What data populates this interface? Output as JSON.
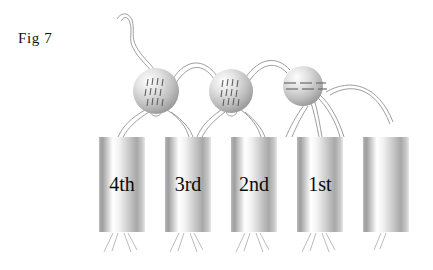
{
  "figure": {
    "label": "Fig 7",
    "background": "#ffffff",
    "ink": "#111111"
  },
  "cylinders": {
    "count": 5,
    "fill_light": "#ffffff",
    "fill_dark": "#9a9a9a",
    "geometry": {
      "top": 137,
      "bottom": 232,
      "width": 46,
      "gap": 20,
      "first_x": 99
    },
    "items": [
      {
        "name": "cylinder-4th",
        "label": "4th",
        "x": 99
      },
      {
        "name": "cylinder-3rd",
        "label": "3rd",
        "x": 165
      },
      {
        "name": "cylinder-2nd",
        "label": "2nd",
        "x": 231
      },
      {
        "name": "cylinder-1st",
        "label": "1st",
        "x": 297
      },
      {
        "name": "cylinder-unlabeled",
        "label": "",
        "x": 363
      }
    ]
  },
  "spheres": {
    "count": 3,
    "highlight": "#fdfdfd",
    "shade": "#8e8e8e",
    "items": [
      {
        "name": "sphere-left",
        "cx": 156,
        "cy": 91,
        "r": 23,
        "marking": "vertical-ticks"
      },
      {
        "name": "sphere-middle",
        "cx": 231,
        "cy": 91,
        "r": 22,
        "marking": "vertical-ticks"
      },
      {
        "name": "sphere-right",
        "cx": 303,
        "cy": 86,
        "r": 20,
        "marking": "horizontal-dashes"
      }
    ]
  },
  "threads": {
    "color": "#8d8d8d",
    "description": "thin double-strand filaments",
    "wavy_inlet": "top-left wavy thread entering left sphere"
  }
}
